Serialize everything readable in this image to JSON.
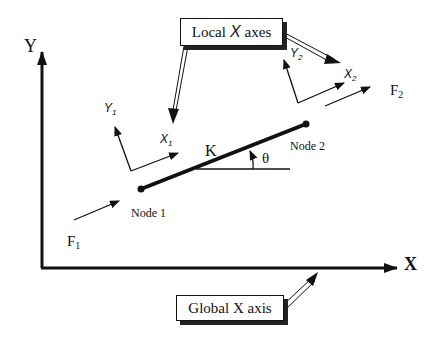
{
  "diagram": {
    "global_axes": {
      "y_label": "Y",
      "x_label": "X"
    },
    "element": {
      "stiffness_label": "K",
      "angle_label": "θ",
      "node1_label": "Node 1",
      "node2_label": "Node 2"
    },
    "forces": {
      "f1": "F",
      "f1_sub": "1",
      "f2": "F",
      "f2_sub": "2"
    },
    "local_axes_node1": {
      "x": "X",
      "x_sub": "1",
      "y": "Y",
      "y_sub": "1"
    },
    "local_axes_node2": {
      "x": "X",
      "x_sub": "2",
      "y": "Y",
      "y_sub": "2"
    },
    "callouts": {
      "local_prefix": "Local",
      "local_mid": "X",
      "local_suffix": "axes",
      "global": "Global X axis"
    },
    "colors": {
      "ink": "#111111",
      "background": "#ffffff"
    }
  }
}
